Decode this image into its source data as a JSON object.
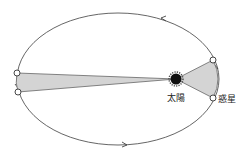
{
  "diagram": {
    "labels": {
      "sun": "太陽",
      "planet": "惑星"
    },
    "colors": {
      "orbit": "#555555",
      "sector_fill": "#d4d4d4",
      "sector_stroke": "#666666",
      "sun": "#111111",
      "planet_fill": "#ffffff",
      "planet_stroke": "#333333"
    }
  }
}
